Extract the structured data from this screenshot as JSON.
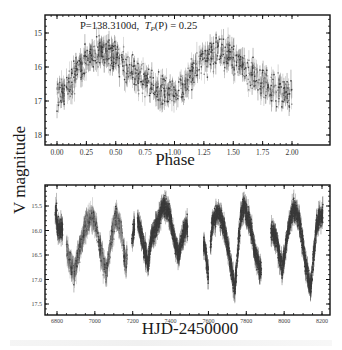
{
  "figure": {
    "y_axis_label": "V magnitude",
    "top_panel": {
      "annotation": "P=138.3100d,  T_P(P) = 0.25",
      "annotation_parts": {
        "prefix": "P=138.3100d, ",
        "tp": "T",
        "tp_sub": "P",
        "suffix": "(P) = 0.25"
      },
      "xlabel": "Phase",
      "xticks": [
        "0.00",
        "0.25",
        "0.50",
        "0.75",
        "1.00",
        "1.25",
        "1.50",
        "1.75",
        "2.00"
      ],
      "yticks": [
        "15",
        "16",
        "17",
        "18"
      ]
    },
    "bottom_panel": {
      "xlabel": "HJD-2450000",
      "xticks": [
        "6800",
        "7000",
        "7200",
        "7400",
        "7600",
        "7800",
        "8000",
        "8200"
      ],
      "yticks": [
        "15.5",
        "16.0",
        "16.5",
        "17.0",
        "17.5"
      ]
    },
    "colors": {
      "data": "#3a3a3a",
      "data_light": "#8a8a8a",
      "frame": "#111111",
      "text": "#222222"
    }
  },
  "chart_data": [
    {
      "type": "scatter",
      "title": "P=138.3100d, T_P(P) = 0.25",
      "xlabel": "Phase",
      "ylabel": "V magnitude",
      "xlim": [
        -0.08,
        2.08
      ],
      "ylim": [
        18.3,
        14.4
      ],
      "y_inverted": true,
      "grid": false,
      "description": "Phase-folded light curve with error bars, shown over two cycles",
      "series": [
        {
          "name": "phased V magnitude (mean trend)",
          "x": [
            0.0,
            0.05,
            0.1,
            0.15,
            0.2,
            0.25,
            0.3,
            0.35,
            0.4,
            0.45,
            0.5,
            0.55,
            0.6,
            0.65,
            0.7,
            0.75,
            0.8,
            0.85,
            0.9,
            0.95,
            1.0,
            1.05,
            1.1,
            1.15,
            1.2,
            1.25,
            1.3,
            1.35,
            1.4,
            1.45,
            1.5,
            1.55,
            1.6,
            1.65,
            1.7,
            1.75,
            1.8,
            1.85,
            1.9,
            1.95,
            2.0
          ],
          "y": [
            16.8,
            16.7,
            16.5,
            16.2,
            15.95,
            15.75,
            15.65,
            15.6,
            15.6,
            15.65,
            15.75,
            15.9,
            16.05,
            16.2,
            16.35,
            16.45,
            16.55,
            16.65,
            16.7,
            16.75,
            16.8,
            16.7,
            16.5,
            16.2,
            15.95,
            15.75,
            15.65,
            15.6,
            15.6,
            15.65,
            15.75,
            15.9,
            16.05,
            16.2,
            16.35,
            16.45,
            16.55,
            16.65,
            16.7,
            16.75,
            16.8
          ],
          "scatter_spread": 0.35
        }
      ]
    },
    {
      "type": "scatter",
      "xlabel": "HJD-2450000",
      "ylabel": "V magnitude",
      "xlim": [
        6720,
        8240
      ],
      "ylim": [
        17.7,
        15.1
      ],
      "y_inverted": true,
      "grid": false,
      "description": "Time-series light curve with error bars",
      "series": [
        {
          "name": "V magnitude vs time (trend points)",
          "x": [
            6800,
            6830,
            6860,
            6890,
            6920,
            6950,
            6980,
            7000,
            7030,
            7060,
            7090,
            7110,
            7140,
            7160,
            7200,
            7220,
            7250,
            7280,
            7300,
            7330,
            7360,
            7390,
            7420,
            7440,
            7460,
            7480,
            7580,
            7600,
            7620,
            7650,
            7680,
            7710,
            7740,
            7770,
            7790,
            7820,
            7850,
            7880,
            7900,
            7920,
            7960,
            7990,
            8020,
            8050,
            8080,
            8110,
            8140,
            8170,
            8200
          ],
          "y": [
            15.9,
            16.0,
            16.5,
            16.9,
            16.4,
            15.9,
            15.75,
            15.8,
            16.4,
            16.9,
            16.1,
            15.7,
            16.0,
            16.7,
            16.1,
            15.7,
            16.2,
            16.7,
            16.1,
            15.9,
            15.5,
            15.6,
            16.2,
            16.5,
            16.2,
            15.9,
            16.3,
            16.9,
            15.85,
            15.6,
            15.9,
            16.5,
            17.2,
            15.7,
            15.5,
            15.9,
            16.5,
            16.9,
            17.0,
            15.95,
            16.2,
            16.8,
            16.0,
            15.55,
            15.8,
            16.6,
            17.2,
            15.9,
            15.65
          ],
          "scatter_spread": 0.2
        }
      ]
    }
  ]
}
